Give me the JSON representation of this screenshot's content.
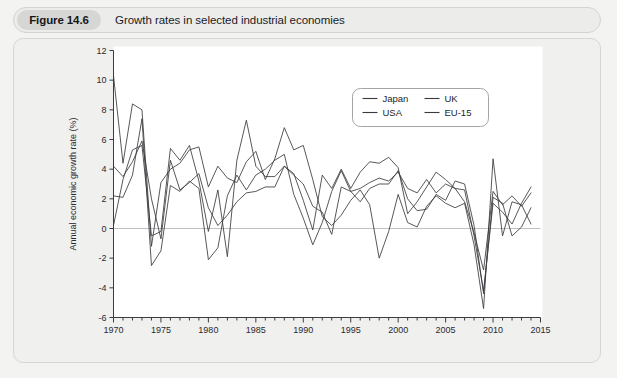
{
  "figure": {
    "badge": "Figure 14.6",
    "caption": "Growth rates in selected industrial economies"
  },
  "chart_data": {
    "type": "line",
    "title": "Growth rates in selected industrial economies",
    "xlabel": "",
    "ylabel": "Annual economic growth rate (%)",
    "xlim": [
      1970,
      2015
    ],
    "ylim": [
      -6,
      12
    ],
    "yticks": [
      -6,
      -4,
      -2,
      0,
      2,
      4,
      6,
      8,
      10,
      12
    ],
    "ytick_labels": [
      "-6",
      "-4",
      "-2",
      "0",
      "2",
      "4",
      "6",
      "8",
      "10",
      "12"
    ],
    "xticks": [
      1970,
      1975,
      1980,
      1985,
      1990,
      1995,
      2000,
      2005,
      2010,
      2015
    ],
    "xtick_labels": [
      "1970",
      "1975",
      "1980",
      "1985",
      "1990",
      "1995",
      "2000",
      "2005",
      "2010",
      "2015"
    ],
    "x_minor_tick_step": 1,
    "grid": false,
    "zero_line": true,
    "legend_position": "top-center-right",
    "legend_entries": [
      "Japan",
      "USA",
      "UK",
      "EU-15"
    ],
    "x": [
      1970,
      1971,
      1972,
      1973,
      1974,
      1975,
      1976,
      1977,
      1978,
      1979,
      1980,
      1981,
      1982,
      1983,
      1984,
      1985,
      1986,
      1987,
      1988,
      1989,
      1990,
      1991,
      1992,
      1993,
      1994,
      1995,
      1996,
      1997,
      1998,
      1999,
      2000,
      2001,
      2002,
      2003,
      2004,
      2005,
      2006,
      2007,
      2008,
      2009,
      2010,
      2011,
      2012,
      2013,
      2014
    ],
    "series": [
      {
        "name": "Japan",
        "color": "#3a3a3e",
        "values": [
          10.3,
          4.4,
          8.4,
          8.0,
          -1.2,
          3.1,
          4.0,
          4.4,
          5.3,
          5.5,
          2.8,
          4.2,
          3.4,
          3.1,
          4.5,
          5.2,
          3.3,
          4.7,
          6.8,
          5.3,
          5.6,
          3.3,
          0.8,
          0.2,
          0.9,
          1.9,
          2.6,
          1.6,
          -2.0,
          -0.2,
          2.3,
          0.4,
          0.1,
          1.5,
          2.2,
          1.7,
          1.4,
          1.7,
          -1.1,
          -5.4,
          4.7,
          -0.5,
          1.8,
          1.6,
          0.3
        ]
      },
      {
        "name": "USA",
        "color": "#3a3a3e",
        "values": [
          0.2,
          3.3,
          5.3,
          5.6,
          -0.5,
          -0.2,
          5.4,
          4.6,
          5.6,
          3.2,
          -0.2,
          2.6,
          -1.9,
          4.6,
          7.3,
          4.2,
          3.5,
          3.5,
          4.2,
          3.7,
          1.9,
          -0.1,
          3.6,
          2.7,
          4.0,
          2.7,
          3.8,
          4.5,
          4.4,
          4.8,
          4.1,
          1.0,
          1.8,
          2.8,
          3.8,
          3.3,
          2.7,
          1.8,
          -0.3,
          -2.8,
          2.5,
          1.6,
          2.2,
          1.5,
          2.4
        ]
      },
      {
        "name": "UK",
        "color": "#3a3a3e",
        "values": [
          2.2,
          2.1,
          3.6,
          7.4,
          -2.5,
          -1.5,
          2.9,
          2.5,
          3.2,
          2.7,
          -2.1,
          -1.3,
          2.2,
          3.6,
          2.6,
          3.6,
          4.0,
          4.6,
          5.0,
          2.3,
          0.7,
          -1.1,
          0.4,
          2.5,
          3.9,
          2.5,
          2.7,
          3.1,
          3.4,
          3.2,
          3.8,
          2.7,
          2.4,
          3.3,
          2.4,
          3.0,
          2.7,
          2.6,
          -0.5,
          -4.2,
          1.7,
          1.1,
          0.3,
          1.7,
          2.8
        ]
      },
      {
        "name": "EU-15",
        "color": "#3a3a3e",
        "values": [
          4.2,
          3.5,
          4.5,
          5.9,
          2.0,
          -0.7,
          4.6,
          2.6,
          3.1,
          3.7,
          1.4,
          0.2,
          0.9,
          1.8,
          2.4,
          2.5,
          2.8,
          2.8,
          4.2,
          3.6,
          3.0,
          1.5,
          1.1,
          -0.4,
          2.8,
          2.5,
          1.8,
          2.7,
          3.0,
          3.0,
          3.9,
          2.0,
          1.2,
          1.3,
          2.3,
          1.9,
          3.2,
          3.0,
          0.2,
          -4.4,
          2.1,
          1.7,
          -0.5,
          0.1,
          1.4
        ]
      }
    ]
  }
}
